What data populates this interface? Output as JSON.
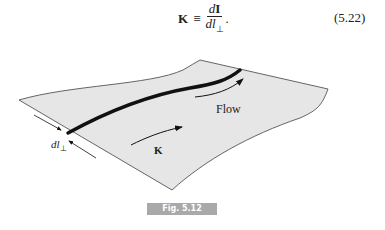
{
  "equation": {
    "lhs": "K",
    "operator": "≡",
    "numerator": "dI",
    "denominator": "dl⊥",
    "trailing": ".",
    "number": "(5.22)"
  },
  "figure": {
    "labels": {
      "flow": "Flow",
      "current_density": "K",
      "width": "dl",
      "width_subscript": "⊥"
    },
    "colors": {
      "sheet_fill": "#e6e6e6",
      "outline": "#555555",
      "stripe": "#111111"
    }
  },
  "caption": {
    "label": "Fig. 5.12",
    "background": "#a9a9a9"
  }
}
